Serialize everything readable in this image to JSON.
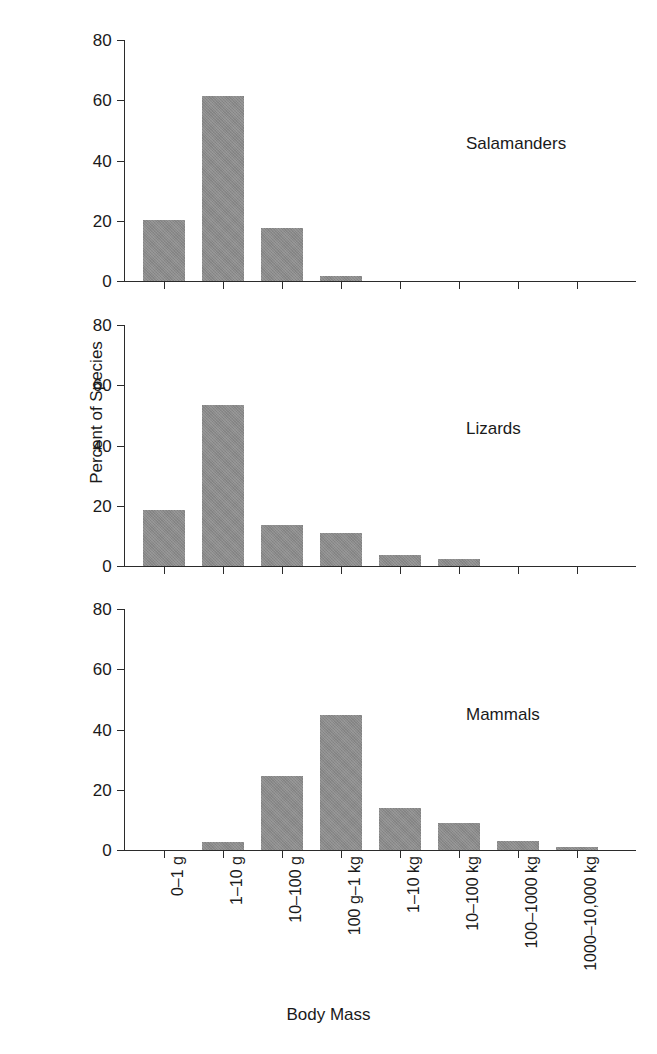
{
  "chart_data": {
    "type": "bar",
    "title": "",
    "xlabel": "Body Mass",
    "ylabel": "Percent of Species",
    "ylim": [
      0,
      80
    ],
    "yticks": [
      0,
      20,
      40,
      60,
      80
    ],
    "grid": false,
    "legend": "none",
    "orientation": "vertical",
    "panel_layout": "3 stacked panels sharing x-axis",
    "bar_color": "#8a8a8a",
    "axis_color": "#2b2b2b",
    "categories": [
      "0–1 g",
      "1–10 g",
      "10–100 g",
      "100 g–1 kg",
      "1–10 kg",
      "10–100 kg",
      "100–1000 kg",
      "1000–10,000 kg"
    ],
    "panels": [
      {
        "name": "Salamanders",
        "label": "Salamanders",
        "values": [
          20.3,
          61.3,
          17.6,
          1.7,
          0,
          0,
          0,
          0
        ]
      },
      {
        "name": "Lizards",
        "label": "Lizards",
        "values": [
          18.5,
          53.4,
          13.5,
          10.8,
          3.8,
          2.2,
          0,
          0
        ]
      },
      {
        "name": "Mammals",
        "label": "Mammals",
        "values": [
          0,
          2.8,
          24.5,
          44.8,
          14.0,
          9.0,
          3.0,
          1.0
        ]
      }
    ]
  }
}
